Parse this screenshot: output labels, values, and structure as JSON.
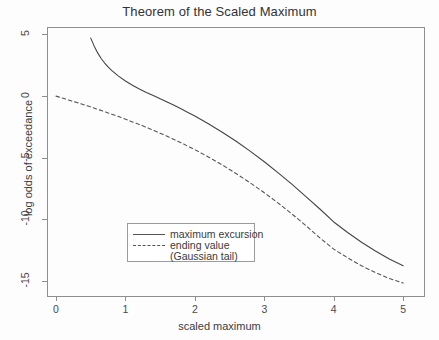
{
  "chart_data": {
    "type": "line",
    "title": "Theorem of the Scaled Maximum",
    "xlabel": "scaled maximum",
    "ylabel": "log odds of exceedance",
    "xlim": [
      -0.13,
      5.3
    ],
    "ylim": [
      -16.2,
      5.6
    ],
    "xticks": [
      0,
      1,
      2,
      3,
      4,
      5
    ],
    "xtick_labels": [
      "0",
      "1",
      "2",
      "3",
      "4",
      "5"
    ],
    "yticks": [
      5,
      0,
      -5,
      -10,
      -15
    ],
    "ytick_labels": [
      "5",
      "0",
      "-5",
      "-10",
      "-15"
    ],
    "grid": false,
    "legend_position": "lower-left-inside",
    "legend_entries": [
      {
        "label": "maximum excursion",
        "style": "solid"
      },
      {
        "label": "ending value",
        "style": "dashed"
      },
      {
        "label": "(Gaussian tail)",
        "style": "none"
      }
    ],
    "series": [
      {
        "name": "maximum excursion",
        "style": "solid",
        "color": "#444444",
        "x": [
          0.5,
          0.55,
          0.6,
          0.65,
          0.7,
          0.75,
          0.8,
          0.9,
          1.0,
          1.1,
          1.2,
          1.3,
          1.4,
          1.5,
          1.6,
          1.7,
          1.8,
          1.9,
          2.0,
          2.2,
          2.4,
          2.6,
          2.8,
          3.0,
          3.2,
          3.4,
          3.6,
          3.8,
          4.0,
          4.2,
          4.4,
          4.6,
          4.8,
          5.0
        ],
        "y": [
          4.7,
          4.05,
          3.5,
          3.05,
          2.68,
          2.36,
          2.08,
          1.62,
          1.22,
          0.88,
          0.58,
          0.3,
          0.04,
          -0.22,
          -0.48,
          -0.74,
          -1.02,
          -1.32,
          -1.62,
          -2.26,
          -2.95,
          -3.68,
          -4.48,
          -5.32,
          -6.22,
          -7.16,
          -8.14,
          -9.15,
          -10.2,
          -11.05,
          -11.85,
          -12.55,
          -13.2,
          -13.75
        ]
      },
      {
        "name": "ending value",
        "style": "dashed",
        "color": "#555555",
        "x": [
          0.0,
          0.1,
          0.2,
          0.3,
          0.4,
          0.5,
          0.6,
          0.7,
          0.8,
          0.9,
          1.0,
          1.2,
          1.4,
          1.6,
          1.8,
          2.0,
          2.2,
          2.4,
          2.6,
          2.8,
          3.0,
          3.2,
          3.4,
          3.6,
          3.8,
          4.0,
          4.2,
          4.4,
          4.6,
          4.8,
          5.0
        ],
        "y": [
          0.0,
          -0.17,
          -0.35,
          -0.52,
          -0.7,
          -0.88,
          -1.07,
          -1.26,
          -1.46,
          -1.66,
          -1.87,
          -2.3,
          -2.76,
          -3.25,
          -3.78,
          -4.34,
          -4.95,
          -5.6,
          -6.3,
          -7.04,
          -7.83,
          -8.67,
          -9.56,
          -10.5,
          -11.49,
          -12.4,
          -13.1,
          -13.75,
          -14.3,
          -14.78,
          -15.15
        ]
      }
    ]
  },
  "colors": {
    "background": "#fdfdfd",
    "axis": "#8f8f8f",
    "solid_line": "#444444",
    "dashed_line": "#555555",
    "text": "#3a3a3a"
  },
  "plot_box": {
    "left": 47,
    "top": 27,
    "right": 424,
    "bottom": 296
  }
}
